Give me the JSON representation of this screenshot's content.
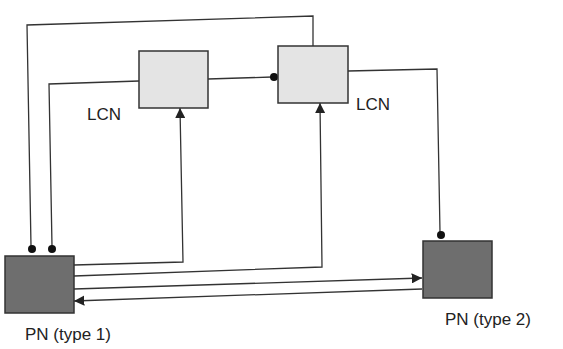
{
  "nodes": {
    "lcn1": {
      "label": "LCN"
    },
    "lcn2": {
      "label": "LCN"
    },
    "pn1": {
      "label": "PN (type 1)"
    },
    "pn2": {
      "label": "PN (type 2)"
    }
  },
  "colors": {
    "lcn_fill": "#e4e4e4",
    "pn_fill": "#6e6e6e",
    "line": "#333333"
  }
}
